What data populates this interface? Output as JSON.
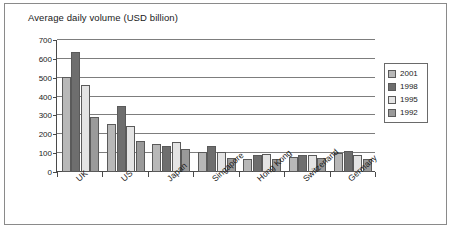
{
  "chart_data": {
    "type": "bar",
    "title": "Average daily volume (USD billion)",
    "xlabel": "",
    "ylabel": "",
    "ylim": [
      0,
      700
    ],
    "yticks": [
      0,
      100,
      200,
      300,
      400,
      500,
      600,
      700
    ],
    "grid": true,
    "legend_position": "right",
    "categories": [
      "UK",
      "US",
      "Japan",
      "Singapore",
      "Hong Kong",
      "Switzerland",
      "Germany"
    ],
    "series": [
      {
        "name": "2001",
        "color": "#b8b8b8",
        "values": [
          505,
          254,
          147,
          106,
          71,
          79,
          99
        ]
      },
      {
        "name": "1998",
        "color": "#6e6e6e",
        "values": [
          637,
          351,
          136,
          139,
          88,
          92,
          112
        ]
      },
      {
        "name": "1995",
        "color": "#e4e4e4",
        "values": [
          464,
          244,
          161,
          107,
          97,
          92,
          89
        ]
      },
      {
        "name": "1992",
        "color": "#9a9a9a",
        "values": [
          291,
          167,
          124,
          76,
          68,
          76,
          67
        ]
      }
    ]
  },
  "legend": {
    "items": [
      {
        "label": "2001",
        "color": "#b8b8b8"
      },
      {
        "label": "1998",
        "color": "#6e6e6e"
      },
      {
        "label": "1995",
        "color": "#e4e4e4"
      },
      {
        "label": "1992",
        "color": "#9a9a9a"
      }
    ]
  },
  "axis": {
    "y_tick_labels": [
      "700",
      "600",
      "500",
      "400",
      "300",
      "200",
      "100",
      "0"
    ]
  }
}
